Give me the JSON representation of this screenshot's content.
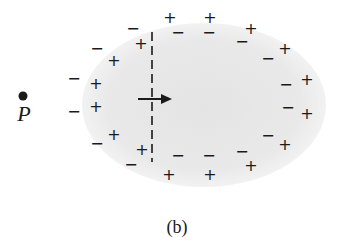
{
  "figure": {
    "caption": "(b)",
    "point": {
      "label": "P",
      "dot": {
        "x": 23,
        "y": 96,
        "r": 4.5
      },
      "label_pos": {
        "x": 24,
        "y": 114
      }
    },
    "ellipse": {
      "cx": 204,
      "cy": 105,
      "rx": 122,
      "ry": 82,
      "fill": "#e9e9e9"
    },
    "dashed_line": {
      "x": 152,
      "y1": 32,
      "y2": 162
    },
    "arrow": {
      "x1": 138,
      "x2": 172,
      "y": 99
    },
    "caption_pos": {
      "x": 177,
      "y": 227
    },
    "colors": {
      "ink": "#1a1a1a",
      "shading": "#e9e9e9"
    },
    "charges": [
      {
        "sign": "−",
        "x": 133,
        "y": 29
      },
      {
        "sign": "+",
        "x": 170,
        "y": 18
      },
      {
        "sign": "+",
        "x": 210,
        "y": 18
      },
      {
        "sign": "−",
        "x": 178,
        "y": 33
      },
      {
        "sign": "−",
        "x": 209,
        "y": 33
      },
      {
        "sign": "+",
        "x": 141,
        "y": 44
      },
      {
        "sign": "−",
        "x": 97,
        "y": 49
      },
      {
        "sign": "+",
        "x": 114,
        "y": 61
      },
      {
        "sign": "−",
        "x": 242,
        "y": 42
      },
      {
        "sign": "+",
        "x": 251,
        "y": 29
      },
      {
        "sign": "−",
        "x": 268,
        "y": 59
      },
      {
        "sign": "+",
        "x": 285,
        "y": 49
      },
      {
        "sign": "−",
        "x": 286,
        "y": 85
      },
      {
        "sign": "+",
        "x": 307,
        "y": 80
      },
      {
        "sign": "−",
        "x": 288,
        "y": 108
      },
      {
        "sign": "+",
        "x": 307,
        "y": 114
      },
      {
        "sign": "−",
        "x": 74,
        "y": 79
      },
      {
        "sign": "+",
        "x": 96,
        "y": 84
      },
      {
        "sign": "−",
        "x": 74,
        "y": 112
      },
      {
        "sign": "+",
        "x": 96,
        "y": 107
      },
      {
        "sign": "−",
        "x": 97,
        "y": 144
      },
      {
        "sign": "+",
        "x": 114,
        "y": 135
      },
      {
        "sign": "−",
        "x": 131,
        "y": 165
      },
      {
        "sign": "+",
        "x": 142,
        "y": 150
      },
      {
        "sign": "−",
        "x": 178,
        "y": 156
      },
      {
        "sign": "+",
        "x": 169,
        "y": 175
      },
      {
        "sign": "−",
        "x": 209,
        "y": 156
      },
      {
        "sign": "+",
        "x": 210,
        "y": 175
      },
      {
        "sign": "−",
        "x": 242,
        "y": 152
      },
      {
        "sign": "+",
        "x": 251,
        "y": 166
      },
      {
        "sign": "−",
        "x": 268,
        "y": 136
      },
      {
        "sign": "+",
        "x": 285,
        "y": 145
      }
    ]
  }
}
